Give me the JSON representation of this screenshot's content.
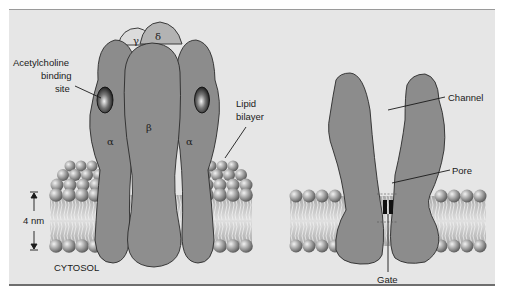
{
  "figure": {
    "left_panel": {
      "subunits": {
        "gamma": "γ",
        "delta": "δ",
        "alpha_left": "α",
        "beta": "β",
        "alpha_right": "α"
      },
      "labels": {
        "binding_site_line1": "Acetylcholine",
        "binding_site_line2": "binding",
        "binding_site_line3": "site",
        "lipid_line1": "Lipid",
        "lipid_line2": "bilayer",
        "thickness": "4 nm",
        "cytosol": "CYTOSOL"
      }
    },
    "right_panel": {
      "labels": {
        "channel": "Channel",
        "pore": "Pore",
        "gate": "Gate"
      }
    },
    "colors": {
      "background": "#e6e6e6",
      "protein": "#8c8c8c",
      "protein_light_gamma": "#d9d9d9",
      "protein_delta": "#b0b0b0",
      "outline": "#2a2a2a",
      "lipid_head": "#9a9a9a",
      "gate": "#111111"
    }
  }
}
